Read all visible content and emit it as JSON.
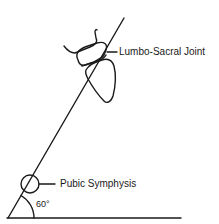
{
  "diagram": {
    "labels": {
      "lumbo_sacral": "Lumbo-Sacral Joint",
      "pubic_symphysis": "Pubic Symphysis",
      "angle": "60°"
    },
    "colors": {
      "stroke": "#1a1a1a",
      "background": "#ffffff"
    }
  }
}
